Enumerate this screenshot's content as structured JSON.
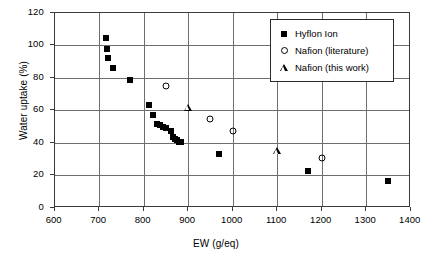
{
  "chart_data": {
    "type": "scatter",
    "title": "",
    "xlabel": "EW (g/eq)",
    "ylabel": "Water uptake (%)",
    "xlim": [
      600,
      1400
    ],
    "ylim": [
      0,
      120
    ],
    "xticks": [
      600,
      700,
      800,
      900,
      1000,
      1100,
      1200,
      1300,
      1400
    ],
    "yticks": [
      0,
      20,
      40,
      60,
      80,
      100,
      120
    ],
    "grid": true,
    "legend_position": "upper right",
    "series": [
      {
        "name": "Hyflon Ion",
        "marker": "filled-square",
        "points": [
          [
            716,
            104.5
          ],
          [
            717,
            97.8
          ],
          [
            719,
            92.3
          ],
          [
            732,
            85.8
          ],
          [
            770,
            78.5
          ],
          [
            813,
            63.2
          ],
          [
            820,
            57.0
          ],
          [
            831,
            51.5
          ],
          [
            836,
            51.0
          ],
          [
            843,
            49.7
          ],
          [
            851,
            49.0
          ],
          [
            861,
            47.3
          ],
          [
            866,
            43.5
          ],
          [
            870,
            42.5
          ],
          [
            874,
            41.6
          ],
          [
            879,
            40.8
          ],
          [
            884,
            40.2
          ],
          [
            970,
            33.3
          ],
          [
            1170,
            22.5
          ],
          [
            1350,
            16.3
          ]
        ]
      },
      {
        "name": "Nafion (literature)",
        "marker": "open-circle",
        "points": [
          [
            851,
            75.0
          ],
          [
            950,
            54.5
          ],
          [
            1000,
            47.0
          ],
          [
            1200,
            30.5
          ]
        ]
      },
      {
        "name": "Nafion (this work)",
        "marker": "open-triangle",
        "points": [
          [
            900,
            62.0
          ],
          [
            1100,
            35.0
          ]
        ]
      }
    ]
  },
  "legend": {
    "items": [
      {
        "label": "Hyflon Ion",
        "marker": "filled-square"
      },
      {
        "label": "Nafion (literature)",
        "marker": "open-circle"
      },
      {
        "label": "Nafion (this work)",
        "marker": "open-triangle"
      }
    ]
  },
  "axes": {
    "x_title": "EW (g/eq)",
    "y_title": "Water uptake (%)"
  }
}
